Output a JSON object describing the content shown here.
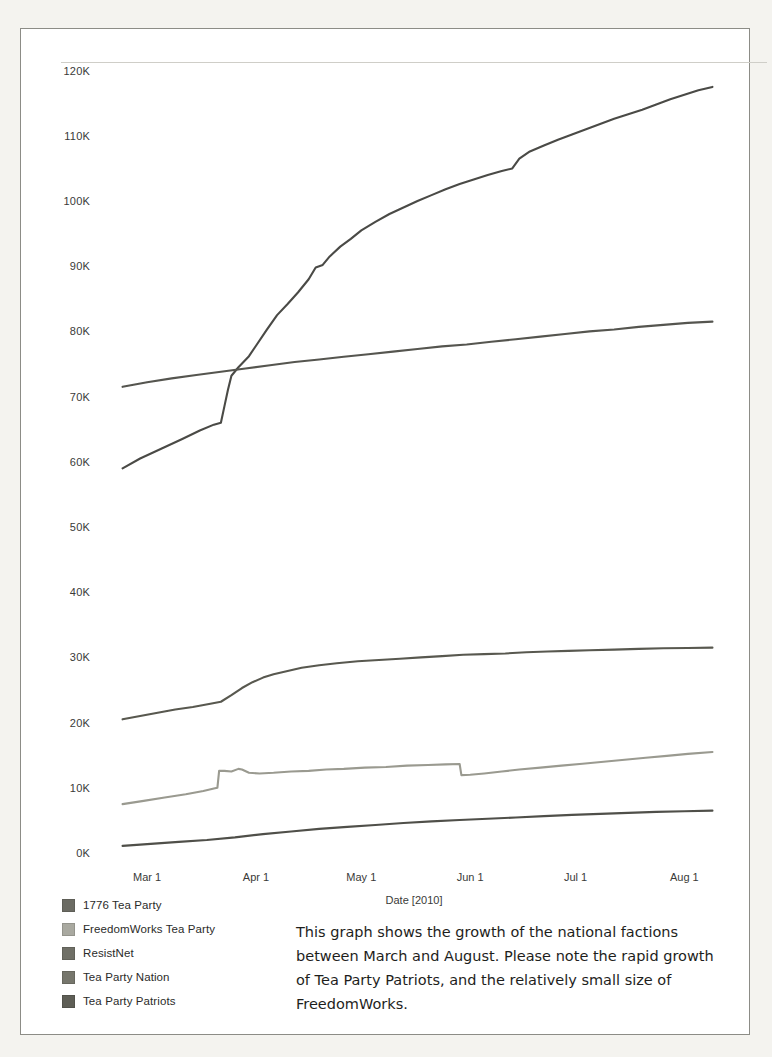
{
  "figure": {
    "caption": "This graph shows the growth of the national factions between March and August. Please note the rapid growth of Tea Party Patriots, and the relatively small size of FreedomWorks."
  },
  "chart_data": {
    "type": "line",
    "title": "",
    "xlabel": "Date [2010]",
    "ylabel": "",
    "grid": false,
    "legend_position": "bottom-left",
    "xlim": [
      0,
      180
    ],
    "ylim": [
      0,
      125000
    ],
    "yticks": [
      0,
      10000,
      20000,
      30000,
      40000,
      50000,
      60000,
      70000,
      80000,
      90000,
      100000,
      110000,
      120000
    ],
    "ytick_labels": [
      "0K",
      "10K",
      "20K",
      "30K",
      "40K",
      "50K",
      "60K",
      "70K",
      "80K",
      "90K",
      "100K",
      "110K",
      "120K"
    ],
    "xticks": [
      14,
      45,
      75,
      106,
      136,
      167
    ],
    "xtick_labels": [
      "Mar 1",
      "Apr 1",
      "May 1",
      "Jun 1",
      "Jul 1",
      "Aug 1"
    ],
    "x_unit": "days from Feb 15 2010",
    "series": [
      {
        "name": "Tea Party Patriots",
        "color": "#4a4a46",
        "points": [
          [
            7,
            59000
          ],
          [
            12,
            60500
          ],
          [
            18,
            62000
          ],
          [
            24,
            63500
          ],
          [
            29,
            64800
          ],
          [
            33,
            65700
          ],
          [
            35,
            66000
          ],
          [
            36,
            68500
          ],
          [
            37,
            71000
          ],
          [
            38,
            73200
          ],
          [
            40,
            74500
          ],
          [
            43,
            76200
          ],
          [
            45,
            77800
          ],
          [
            48,
            80200
          ],
          [
            51,
            82500
          ],
          [
            54,
            84200
          ],
          [
            57,
            86000
          ],
          [
            60,
            88000
          ],
          [
            62,
            89800
          ],
          [
            64,
            90200
          ],
          [
            66,
            91500
          ],
          [
            69,
            93000
          ],
          [
            72,
            94200
          ],
          [
            75,
            95500
          ],
          [
            79,
            96800
          ],
          [
            83,
            98000
          ],
          [
            87,
            99000
          ],
          [
            91,
            100000
          ],
          [
            95,
            100900
          ],
          [
            99,
            101800
          ],
          [
            103,
            102600
          ],
          [
            107,
            103300
          ],
          [
            111,
            104000
          ],
          [
            115,
            104600
          ],
          [
            118,
            105000
          ],
          [
            120,
            106500
          ],
          [
            123,
            107600
          ],
          [
            127,
            108500
          ],
          [
            131,
            109400
          ],
          [
            135,
            110200
          ],
          [
            139,
            111000
          ],
          [
            143,
            111800
          ],
          [
            147,
            112600
          ],
          [
            151,
            113300
          ],
          [
            155,
            114000
          ],
          [
            159,
            114800
          ],
          [
            163,
            115600
          ],
          [
            167,
            116300
          ],
          [
            171,
            117000
          ],
          [
            175,
            117500
          ]
        ]
      },
      {
        "name": "ResistNet",
        "color": "#55554f",
        "points": [
          [
            7,
            71500
          ],
          [
            14,
            72200
          ],
          [
            21,
            72800
          ],
          [
            28,
            73300
          ],
          [
            35,
            73800
          ],
          [
            42,
            74300
          ],
          [
            49,
            74800
          ],
          [
            56,
            75300
          ],
          [
            63,
            75700
          ],
          [
            70,
            76100
          ],
          [
            77,
            76500
          ],
          [
            84,
            76900
          ],
          [
            91,
            77300
          ],
          [
            98,
            77700
          ],
          [
            105,
            78000
          ],
          [
            112,
            78400
          ],
          [
            119,
            78800
          ],
          [
            126,
            79200
          ],
          [
            133,
            79600
          ],
          [
            140,
            80000
          ],
          [
            147,
            80300
          ],
          [
            154,
            80700
          ],
          [
            161,
            81000
          ],
          [
            168,
            81300
          ],
          [
            175,
            81500
          ]
        ]
      },
      {
        "name": "Tea Party Nation",
        "color": "#58584f",
        "points": [
          [
            7,
            20500
          ],
          [
            12,
            21000
          ],
          [
            17,
            21500
          ],
          [
            22,
            22000
          ],
          [
            27,
            22400
          ],
          [
            32,
            22900
          ],
          [
            35,
            23200
          ],
          [
            38,
            24200
          ],
          [
            41,
            25300
          ],
          [
            44,
            26200
          ],
          [
            47,
            26900
          ],
          [
            50,
            27400
          ],
          [
            54,
            27900
          ],
          [
            58,
            28400
          ],
          [
            63,
            28800
          ],
          [
            68,
            29100
          ],
          [
            74,
            29400
          ],
          [
            80,
            29600
          ],
          [
            86,
            29800
          ],
          [
            92,
            30000
          ],
          [
            98,
            30200
          ],
          [
            104,
            30400
          ],
          [
            110,
            30500
          ],
          [
            116,
            30600
          ],
          [
            122,
            30800
          ],
          [
            128,
            30900
          ],
          [
            134,
            31000
          ],
          [
            140,
            31100
          ],
          [
            147,
            31200
          ],
          [
            154,
            31300
          ],
          [
            161,
            31400
          ],
          [
            168,
            31450
          ],
          [
            175,
            31500
          ]
        ]
      },
      {
        "name": "FreedomWorks Tea Party",
        "color": "#9a9a90",
        "points": [
          [
            7,
            7500
          ],
          [
            13,
            8000
          ],
          [
            19,
            8500
          ],
          [
            25,
            9000
          ],
          [
            30,
            9500
          ],
          [
            33,
            9900
          ],
          [
            34,
            10000
          ],
          [
            34.5,
            12600
          ],
          [
            36,
            12600
          ],
          [
            38,
            12500
          ],
          [
            40,
            12900
          ],
          [
            41,
            12800
          ],
          [
            43,
            12300
          ],
          [
            46,
            12200
          ],
          [
            50,
            12300
          ],
          [
            55,
            12500
          ],
          [
            60,
            12600
          ],
          [
            65,
            12800
          ],
          [
            70,
            12900
          ],
          [
            76,
            13100
          ],
          [
            82,
            13200
          ],
          [
            88,
            13400
          ],
          [
            94,
            13500
          ],
          [
            99,
            13600
          ],
          [
            103,
            13650
          ],
          [
            103.5,
            11950
          ],
          [
            106,
            12000
          ],
          [
            110,
            12200
          ],
          [
            115,
            12500
          ],
          [
            120,
            12800
          ],
          [
            126,
            13100
          ],
          [
            132,
            13400
          ],
          [
            138,
            13700
          ],
          [
            144,
            14000
          ],
          [
            150,
            14300
          ],
          [
            156,
            14600
          ],
          [
            162,
            14900
          ],
          [
            168,
            15200
          ],
          [
            175,
            15500
          ]
        ]
      },
      {
        "name": "1776 Tea Party",
        "color": "#4f4f49",
        "points": [
          [
            7,
            1100
          ],
          [
            15,
            1400
          ],
          [
            23,
            1700
          ],
          [
            31,
            2000
          ],
          [
            39,
            2400
          ],
          [
            47,
            2900
          ],
          [
            55,
            3300
          ],
          [
            63,
            3700
          ],
          [
            71,
            4000
          ],
          [
            79,
            4300
          ],
          [
            87,
            4600
          ],
          [
            95,
            4850
          ],
          [
            103,
            5050
          ],
          [
            111,
            5250
          ],
          [
            119,
            5450
          ],
          [
            127,
            5650
          ],
          [
            135,
            5850
          ],
          [
            143,
            6000
          ],
          [
            151,
            6150
          ],
          [
            159,
            6300
          ],
          [
            167,
            6400
          ],
          [
            175,
            6500
          ]
        ]
      }
    ],
    "legend": [
      {
        "label": "1776 Tea Party",
        "color": "#6b6b63"
      },
      {
        "label": "FreedomWorks Tea Party",
        "color": "#a9a9a0"
      },
      {
        "label": "ResistNet",
        "color": "#6f6f66"
      },
      {
        "label": "Tea Party Nation",
        "color": "#76766c"
      },
      {
        "label": "Tea Party Patriots",
        "color": "#5e5e56"
      }
    ]
  }
}
